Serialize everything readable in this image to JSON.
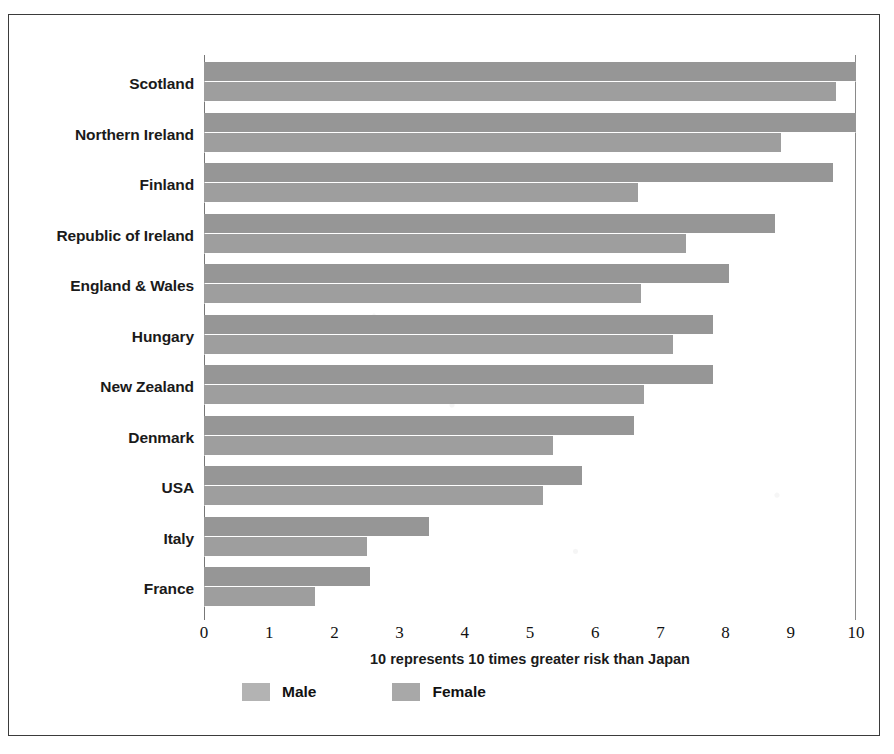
{
  "chart_data": {
    "type": "bar",
    "orientation": "horizontal",
    "title": "",
    "subtitle": "",
    "xlabel": "10 represents 10 times greater risk than Japan",
    "ylabel": "",
    "xlim": [
      0,
      10
    ],
    "xticks": [
      0,
      1,
      2,
      3,
      4,
      5,
      6,
      7,
      8,
      9,
      10
    ],
    "xtick_labels": [
      "0",
      "1",
      "2",
      "3",
      "4",
      "5",
      "6",
      "7",
      "8",
      "9",
      "10"
    ],
    "grid": false,
    "legend_position": "bottom-left",
    "categories": [
      "Scotland",
      "Northern Ireland",
      "Finland",
      "Republic of Ireland",
      "England & Wales",
      "Hungary",
      "New Zealand",
      "Denmark",
      "USA",
      "Italy",
      "France"
    ],
    "series": [
      {
        "name": "Male",
        "color": "#969696",
        "values": [
          10.0,
          10.0,
          9.65,
          8.75,
          8.05,
          7.8,
          7.8,
          6.6,
          5.8,
          3.45,
          2.55
        ]
      },
      {
        "name": "Female",
        "color": "#9e9e9e",
        "values": [
          9.7,
          8.85,
          6.65,
          7.4,
          6.7,
          7.2,
          6.75,
          5.35,
          5.2,
          2.5,
          1.7
        ]
      }
    ]
  },
  "legend": {
    "items": [
      {
        "label": "Male",
        "swatch_class": "male"
      },
      {
        "label": "Female",
        "swatch_class": "female"
      }
    ]
  },
  "colors": {
    "bar_male": "#969696",
    "bar_female": "#9e9e9e",
    "frame": "#3b3b3b",
    "text": "#1a1a1a",
    "background": "#ffffff"
  }
}
